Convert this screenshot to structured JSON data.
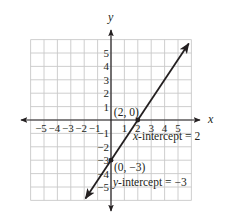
{
  "chart_data": {
    "type": "line",
    "title": "",
    "xlabel": "x",
    "ylabel": "y",
    "xlim": [
      -6,
      6
    ],
    "ylim": [
      -6,
      6
    ],
    "grid": true,
    "x_tick_labels": [
      "−5",
      "−4",
      "−3",
      "−2",
      "−1",
      "1",
      "2",
      "3",
      "4",
      "5"
    ],
    "y_tick_labels": [
      "5",
      "4",
      "3",
      "2",
      "1",
      "−1",
      "−2",
      "−3",
      "−4",
      "−5"
    ],
    "series": [
      {
        "name": "line",
        "equation": "y = (3/2)x - 3",
        "x": [
          -1.9,
          0,
          2,
          5.8
        ],
        "y": [
          -5.85,
          -3,
          0,
          5.7
        ],
        "arrows_both_ends": true
      }
    ],
    "points": [
      {
        "x": 2,
        "y": 0,
        "label": "(2, 0)"
      },
      {
        "x": 0,
        "y": -3,
        "label": "(0, −3)"
      }
    ],
    "annotations": [
      {
        "text": "x-intercept = 2",
        "var": "x",
        "rest": "-intercept = 2"
      },
      {
        "text": "y-intercept = −3",
        "var": "y",
        "rest": "-intercept = −3"
      }
    ]
  },
  "colors": {
    "grid": "#c8c8c8",
    "axis": "#231f20",
    "line": "#231f20",
    "text": "#231f20"
  }
}
